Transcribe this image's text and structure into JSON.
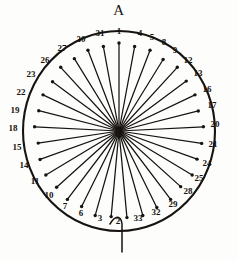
{
  "figure": {
    "title": "A",
    "pointer_present": true,
    "ink_color": "#161310",
    "background_color": "#fdfdfb"
  },
  "chart_data": {
    "type": "scatter",
    "title": "A",
    "subtype": "radial-spoke-diagram",
    "xlabel": "",
    "ylabel": "",
    "grid": false,
    "legend": false,
    "count": 33,
    "angle_step_degrees": 10.909,
    "label_step": 3,
    "modulus": 33,
    "labels_clockwise_from_top": [
      "1",
      "4",
      "5",
      "8",
      "9",
      "12",
      "13",
      "16",
      "17",
      "20",
      "21",
      "24",
      "25",
      "28",
      "29",
      "32",
      "33",
      "2",
      "3",
      "6",
      "7",
      "10",
      "11",
      "14",
      "15",
      "18",
      "19",
      "22",
      "23",
      "26",
      "27",
      "30",
      "31"
    ],
    "categories": [
      "1",
      "4",
      "5",
      "8",
      "9",
      "12",
      "13",
      "16",
      "17",
      "20",
      "21",
      "24",
      "25",
      "28",
      "29",
      "32",
      "33",
      "2",
      "3",
      "6",
      "7",
      "10",
      "11",
      "14",
      "15",
      "18",
      "19",
      "22",
      "23",
      "26",
      "27",
      "30",
      "31"
    ],
    "values": [
      1,
      1,
      1,
      1,
      1,
      1,
      1,
      1,
      1,
      1,
      1,
      1,
      1,
      1,
      1,
      1,
      1,
      1,
      1,
      1,
      1,
      1,
      1,
      1,
      1,
      1,
      1,
      1,
      1,
      1,
      1,
      1,
      1
    ],
    "spoke_lengths_normalized": [
      0.88,
      0.86,
      0.87,
      0.85,
      0.88,
      0.86,
      0.87,
      0.85,
      0.88,
      0.87,
      0.86,
      0.88,
      0.85,
      0.87,
      0.86,
      0.88,
      0.87,
      0.86,
      0.88,
      0.85,
      0.87,
      0.86,
      0.88,
      0.87,
      0.85,
      0.88,
      0.86,
      0.87,
      0.85,
      0.88,
      0.86,
      0.87,
      0.86
    ],
    "center": {
      "x": 119,
      "y": 131
    },
    "radius_x": 96,
    "radius_y": 100,
    "label_radius_x": 110,
    "label_radius_y": 114,
    "pointer": {
      "label": "pointer-line",
      "from_angle_degrees": 185,
      "extends_below_circle": true
    }
  },
  "labels": [
    {
      "text": "1",
      "x": 119,
      "y": 31
    },
    {
      "text": "4",
      "x": 140,
      "y": 33
    },
    {
      "text": "5",
      "x": 152,
      "y": 37
    },
    {
      "text": "8",
      "x": 164,
      "y": 42
    },
    {
      "text": "9",
      "x": 175,
      "y": 50
    },
    {
      "text": "12",
      "x": 188,
      "y": 60
    },
    {
      "text": "13",
      "x": 198,
      "y": 73
    },
    {
      "text": "16",
      "x": 207,
      "y": 89
    },
    {
      "text": "17",
      "x": 212,
      "y": 105
    },
    {
      "text": "20",
      "x": 215,
      "y": 124
    },
    {
      "text": "21",
      "x": 213,
      "y": 144
    },
    {
      "text": "24",
      "x": 207,
      "y": 163
    },
    {
      "text": "25",
      "x": 199,
      "y": 178
    },
    {
      "text": "28",
      "x": 188,
      "y": 191
    },
    {
      "text": "29",
      "x": 173,
      "y": 204
    },
    {
      "text": "32",
      "x": 156,
      "y": 212
    },
    {
      "text": "33",
      "x": 138,
      "y": 218
    },
    {
      "text": "2",
      "x": 118,
      "y": 221
    },
    {
      "text": "3",
      "x": 100,
      "y": 218
    },
    {
      "text": "6",
      "x": 81,
      "y": 213
    },
    {
      "text": "7",
      "x": 65,
      "y": 206
    },
    {
      "text": "10",
      "x": 49,
      "y": 195
    },
    {
      "text": "11",
      "x": 35,
      "y": 181
    },
    {
      "text": "14",
      "x": 24,
      "y": 165
    },
    {
      "text": "15",
      "x": 17,
      "y": 147
    },
    {
      "text": "18",
      "x": 13,
      "y": 128
    },
    {
      "text": "19",
      "x": 15,
      "y": 110
    },
    {
      "text": "22",
      "x": 21,
      "y": 92
    },
    {
      "text": "23",
      "x": 31,
      "y": 74
    },
    {
      "text": "26",
      "x": 45,
      "y": 60
    },
    {
      "text": "27",
      "x": 62,
      "y": 48
    },
    {
      "text": "30",
      "x": 81,
      "y": 39
    },
    {
      "text": "31",
      "x": 100,
      "y": 33
    }
  ]
}
